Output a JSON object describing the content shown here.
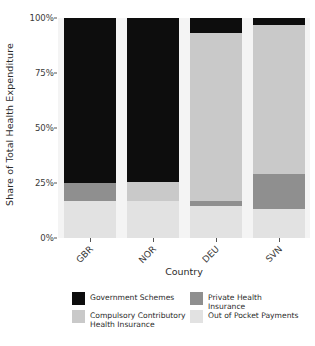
{
  "chart_data": {
    "type": "bar",
    "stacked": true,
    "stack_normalized": true,
    "title": "",
    "subtitle": "",
    "xlabel": "Country",
    "ylabel": "Share of Total Health Expenditure",
    "categories": [
      "GBR",
      "NOR",
      "DEU",
      "SVN"
    ],
    "xtick_labels": [
      "GBR",
      "NOR",
      "DEU",
      "SVN"
    ],
    "xtick_rotation": -45,
    "ytick_labels": [
      "0%",
      "25%",
      "50%",
      "75%",
      "100%"
    ],
    "ytick_values": [
      0,
      25,
      50,
      75,
      100
    ],
    "ylim": [
      0,
      100
    ],
    "grid": false,
    "panel_background": "#f4f4f4",
    "legend_position": "bottom",
    "legend_columns": 2,
    "series": [
      {
        "name": "Government Schemes",
        "color": "#0d0d0d",
        "values": [
          75.0,
          74.5,
          7.0,
          3.0
        ]
      },
      {
        "name": "Compulsory Contributory Health Insurance",
        "color": "#c9c9c9",
        "values": [
          0.0,
          8.5,
          76.0,
          68.0
        ]
      },
      {
        "name": "Private Health Insurance",
        "color": "#8f8f8f",
        "values": [
          8.0,
          0.0,
          2.5,
          16.0
        ]
      },
      {
        "name": "Out of Pocket Payments",
        "color": "#e2e2e2",
        "values": [
          17.0,
          17.0,
          14.5,
          13.0
        ]
      }
    ],
    "annotations": []
  },
  "legend": {
    "items": [
      {
        "label": "Government Schemes",
        "color": "#0d0d0d"
      },
      {
        "label": "Compulsory Contributory\nHealth Insurance",
        "color": "#c9c9c9"
      },
      {
        "label": "Private Health Insurance",
        "color": "#8f8f8f"
      },
      {
        "label": "Out of Pocket Payments",
        "color": "#e2e2e2"
      }
    ]
  }
}
